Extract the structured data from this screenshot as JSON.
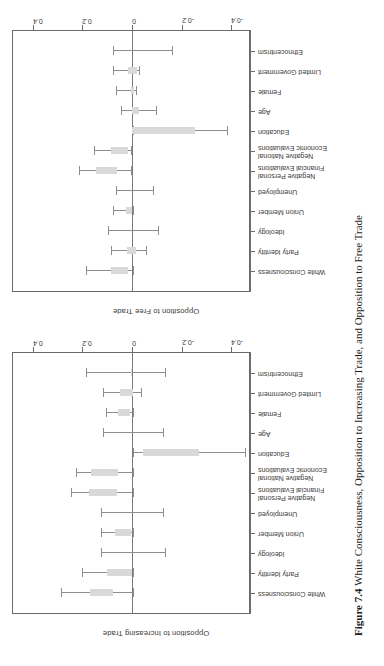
{
  "figure": {
    "caption_label": "Figure 7.4",
    "caption_text": "White Consciousness, Opposition to Increasing Trade, and Opposition to Free Trade"
  },
  "axis": {
    "tick_labels": [
      "-0.4",
      "-0.2",
      "0",
      "0.2",
      "0.4"
    ],
    "tick_values": [
      -0.4,
      -0.2,
      0,
      0.2,
      0.4
    ],
    "ylim": [
      -0.48,
      0.48
    ]
  },
  "categories": [
    "White Consciousness",
    "Party Identity",
    "Ideology",
    "Union Member",
    "Unemployed",
    "Negative Personal\nFinancial Evaluations",
    "Negative National\nEconomic Evaluations",
    "Education",
    "Age",
    "Female",
    "Limited Government",
    "Ethnocentrism"
  ],
  "panels": {
    "left": {
      "axis_title": "Opposition to Increasing Trade"
    },
    "right": {
      "axis_title": "Opposition to Free Trade"
    }
  },
  "colors": {
    "box_fill": "#d9d9d9",
    "whisker": "#8e8e8e",
    "frame": "#6b6b6b",
    "zero_line": "#7a7a7a",
    "text": "#3a3a3a"
  },
  "chart_data": [
    {
      "type": "bar",
      "id": "opposition-to-increasing-trade",
      "title": "Opposition to Increasing Trade",
      "xlabel": "",
      "ylabel": "Opposition to Increasing Trade",
      "ylim": [
        -0.48,
        0.48
      ],
      "yticks": [
        -0.4,
        -0.2,
        0,
        0.2,
        0.4
      ],
      "grid": false,
      "legend": "none",
      "categories": [
        "White Consciousness",
        "Party Identity",
        "Ideology",
        "Union Member",
        "Unemployed",
        "Negative Personal Financial Evaluations",
        "Negative National Economic Evaluations",
        "Education",
        "Age",
        "Female",
        "Limited Government",
        "Ethnocentrism"
      ],
      "estimate": [
        0.17,
        0.1,
        0.0,
        0.07,
        0.0,
        0.175,
        0.165,
        -0.27,
        0.0,
        0.055,
        0.05,
        0.005
      ],
      "box_low": [
        0.075,
        0.0,
        0.0,
        0.005,
        0.0,
        0.06,
        0.055,
        -0.045,
        0.0,
        0.01,
        -0.005,
        0.0
      ],
      "box_high": [
        0.17,
        0.1,
        0.0,
        0.07,
        0.0,
        0.175,
        0.165,
        -0.27,
        0.0,
        0.055,
        0.05,
        0.005
      ],
      "ci_low": [
        -0.005,
        -0.005,
        -0.135,
        -0.005,
        -0.125,
        -0.005,
        -0.005,
        -0.455,
        -0.125,
        -0.005,
        -0.035,
        -0.135
      ],
      "ci_high": [
        0.285,
        0.2,
        0.125,
        0.125,
        0.125,
        0.245,
        0.225,
        -0.005,
        0.115,
        0.105,
        0.115,
        0.185
      ]
    },
    {
      "type": "bar",
      "id": "opposition-to-free-trade",
      "title": "Opposition to Free Trade",
      "xlabel": "",
      "ylabel": "Opposition to Free Trade",
      "ylim": [
        -0.48,
        0.48
      ],
      "yticks": [
        -0.4,
        -0.2,
        0,
        0.2,
        0.4
      ],
      "grid": false,
      "legend": "none",
      "categories": [
        "White Consciousness",
        "Party Identity",
        "Ideology",
        "Union Member",
        "Unemployed",
        "Negative Personal Financial Evaluations",
        "Negative National Economic Evaluations",
        "Education",
        "Age",
        "Female",
        "Limited Government",
        "Ethnocentrism"
      ],
      "estimate": [
        0.085,
        0.02,
        0.0,
        0.025,
        0.0,
        0.145,
        0.085,
        -0.135,
        -0.01,
        0.005,
        0.015,
        0.0
      ],
      "box_low": [
        0.015,
        -0.015,
        0.0,
        0.0,
        0.0,
        0.06,
        0.015,
        -0.255,
        -0.03,
        -0.01,
        -0.02,
        0.0
      ],
      "box_high": [
        0.085,
        0.02,
        0.0,
        0.025,
        0.0,
        0.145,
        0.085,
        0.0,
        0.0,
        0.005,
        0.015,
        0.0
      ],
      "ci_low": [
        -0.005,
        -0.055,
        -0.105,
        -0.005,
        -0.085,
        0.005,
        0.005,
        -0.385,
        -0.095,
        -0.015,
        -0.03,
        -0.16
      ],
      "ci_high": [
        0.185,
        0.085,
        0.095,
        0.075,
        0.065,
        0.215,
        0.155,
        -0.005,
        0.045,
        0.065,
        0.075,
        0.075
      ]
    }
  ]
}
